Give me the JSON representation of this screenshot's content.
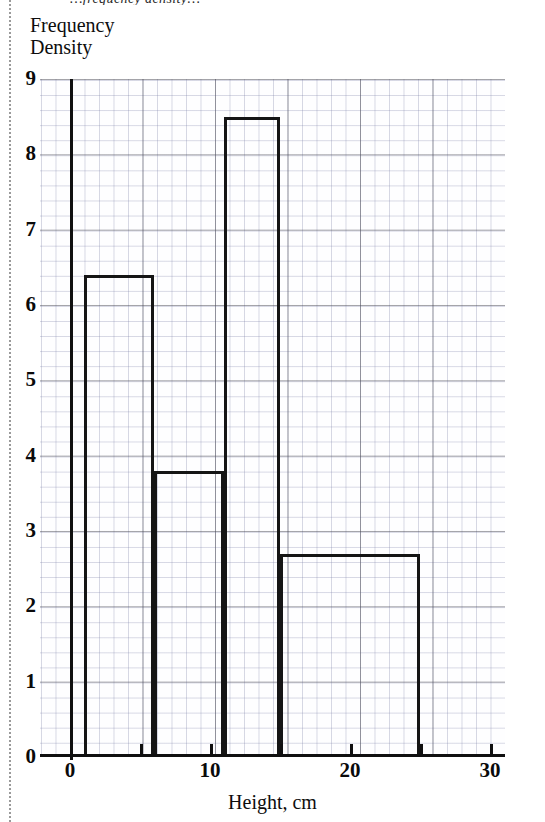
{
  "page": {
    "clipped_top_text": "…frequency density…"
  },
  "axes": {
    "y_title": "Frequency\nDensity",
    "x_title": "Height, cm",
    "y_ticks": [
      "0",
      "1",
      "2",
      "3",
      "4",
      "5",
      "6",
      "7",
      "8",
      "9"
    ],
    "x_ticks": [
      "0",
      "10",
      "20",
      "30"
    ]
  },
  "chart_data": {
    "type": "bar",
    "subtype": "histogram",
    "title": "",
    "xlabel": "Height, cm",
    "ylabel": "Frequency Density",
    "xlim": [
      0,
      30
    ],
    "ylim": [
      0,
      9
    ],
    "x_tick_values": [
      0,
      10,
      20,
      30
    ],
    "y_tick_values": [
      0,
      1,
      2,
      3,
      4,
      5,
      6,
      7,
      8,
      9
    ],
    "x_major_gridline_step": 5,
    "x_minor_gridline_step": 1,
    "y_major_gridline_step": 1,
    "y_minor_gridline_step": 0.2,
    "grid": true,
    "legend": "none",
    "bin_edges": [
      1,
      6,
      11,
      15,
      25
    ],
    "bin_labels": [
      "1–6",
      "6–11",
      "11–15",
      "15–25"
    ],
    "bin_widths": [
      5,
      5,
      4,
      10
    ],
    "values": [
      6.4,
      3.8,
      8.5,
      2.7
    ],
    "frequencies": [
      32,
      19,
      34,
      27
    ],
    "bars": [
      {
        "start": 1,
        "end": 6,
        "width": 5,
        "frequency_density": 6.4
      },
      {
        "start": 6,
        "end": 11,
        "width": 5,
        "frequency_density": 3.8
      },
      {
        "start": 11,
        "end": 15,
        "width": 4,
        "frequency_density": 8.5
      },
      {
        "start": 15,
        "end": 25,
        "width": 10,
        "frequency_density": 2.7
      }
    ],
    "bar_fill": "none",
    "bar_outline_color": "#151515"
  }
}
